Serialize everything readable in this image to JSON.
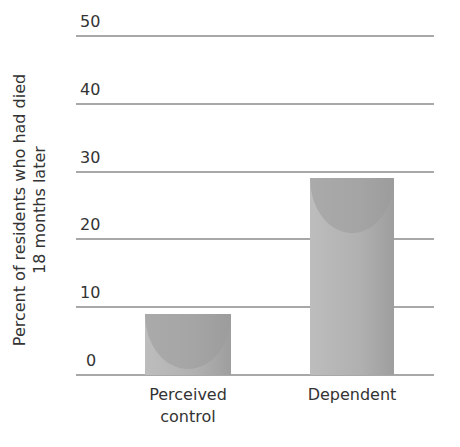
{
  "chart_data": {
    "type": "bar",
    "title": "",
    "xlabel": "",
    "ylabel": "Percent of residents who had died 18 months later",
    "ylabel_lines": [
      "Percent of residents who had died",
      "18 months later"
    ],
    "categories": [
      "Perceived control",
      "Dependent"
    ],
    "category_lines": [
      [
        "Perceived",
        "control"
      ],
      [
        "Dependent"
      ]
    ],
    "values": [
      9,
      29
    ],
    "ylim": [
      0,
      50
    ],
    "yticks": [
      0,
      10,
      20,
      30,
      40,
      50
    ],
    "grid": true,
    "legend": null
  }
}
